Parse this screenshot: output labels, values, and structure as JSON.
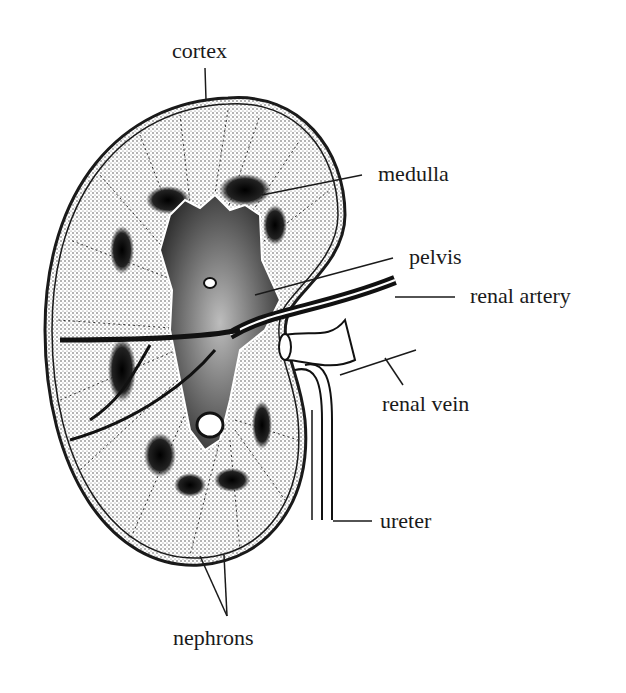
{
  "diagram": {
    "labels": {
      "cortex": "cortex",
      "medulla": "medulla",
      "pelvis": "pelvis",
      "renal_artery": "renal artery",
      "renal_vein": "renal vein",
      "ureter": "ureter",
      "nephrons": "nephrons"
    },
    "colors": {
      "ink": "#1a1a1a",
      "cortex_fill": "#d9d9d9",
      "medulla_dark": "#111111",
      "pelvis_fill": "#8c8c8c",
      "background": "#ffffff"
    }
  }
}
